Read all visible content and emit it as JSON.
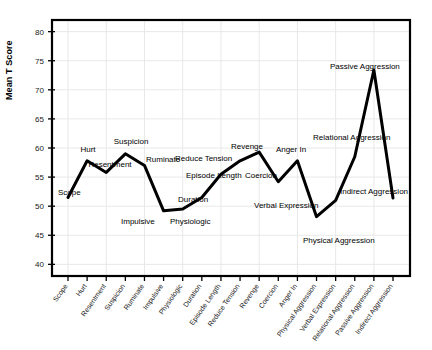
{
  "chart_data": {
    "type": "line",
    "title": "",
    "subtitle": "",
    "xlabel": "",
    "ylabel": "Mean T Score",
    "ylim": [
      38,
      82
    ],
    "yticks": [
      40,
      45,
      50,
      55,
      60,
      65,
      70,
      75,
      80
    ],
    "grid": true,
    "legend": "none",
    "line_color": "#000000",
    "categories": [
      "Scope",
      "Hurt",
      "Resentment",
      "Suspicion",
      "Ruminate",
      "Impulsive",
      "Physiologic",
      "Duration",
      "Episode Length",
      "Reduce Tension",
      "Revenge",
      "Coercion",
      "Anger In",
      "Physical Aggression",
      "Verbal Expression",
      "Relational Aggression",
      "Passive Aggression",
      "Indirect Aggression"
    ],
    "values": [
      51.5,
      57.8,
      55.8,
      59.0,
      57.0,
      49.2,
      49.5,
      51.5,
      55.5,
      57.8,
      59.3,
      54.2,
      57.8,
      48.2,
      51.0,
      58.5,
      73.4,
      51.4
    ],
    "annotations": [
      {
        "label": "Scope",
        "value": 51.5
      },
      {
        "label": "Hurt",
        "value": 57.8
      },
      {
        "label": "Resentment",
        "value": 55.8
      },
      {
        "label": "Suspicion",
        "value": 59.0
      },
      {
        "label": "Ruminate",
        "value": 57.0
      },
      {
        "label": "Impulsive",
        "value": 49.2
      },
      {
        "label": "Physiologic",
        "value": 49.5
      },
      {
        "label": "Duration",
        "value": 51.5
      },
      {
        "label": "Episode Length",
        "value": 55.5
      },
      {
        "label": "Reduce Tension",
        "value": 57.8
      },
      {
        "label": "Revenge",
        "value": 59.3
      },
      {
        "label": "Coercion",
        "value": 54.2
      },
      {
        "label": "Anger In",
        "value": 57.8
      },
      {
        "label": "Physical Aggression",
        "value": 48.2
      },
      {
        "label": "Verbal Expression",
        "value": 51.0
      },
      {
        "label": "Relational Aggression",
        "value": 58.5
      },
      {
        "label": "Passive Aggression",
        "value": 73.4
      },
      {
        "label": "Indirect Aggression",
        "value": 51.4
      }
    ]
  },
  "axis": {
    "y_title": "Mean T Score",
    "y_tick_labels": [
      "80",
      "75",
      "70",
      "65",
      "60",
      "55",
      "50",
      "45",
      "40"
    ],
    "x_tick_labels": [
      "Scope",
      "Hurt",
      "Resentment",
      "Suspicion",
      "Ruminate",
      "Impulsive",
      "Physiologic",
      "Duration",
      "Episode Length",
      "Reduce Tension",
      "Revenge",
      "Coercion",
      "Anger In",
      "Physical Aggression",
      "Verbal Expression",
      "Relational Aggression",
      "Passive Aggression",
      "Indirect Aggression"
    ]
  },
  "annotation_positions": [
    {
      "text": "Scope",
      "x": 58,
      "y": 195,
      "anchor": "start"
    },
    {
      "text": "Hurt",
      "x": 88,
      "y": 152,
      "anchor": "middle"
    },
    {
      "text": "Resentment",
      "x": 110,
      "y": 167,
      "anchor": "middle"
    },
    {
      "text": "Suspicion",
      "x": 131,
      "y": 144,
      "anchor": "middle"
    },
    {
      "text": "Ruminate",
      "x": 146,
      "y": 162,
      "anchor": "start"
    },
    {
      "text": "Impulsive",
      "x": 121,
      "y": 224,
      "anchor": "start"
    },
    {
      "text": "Physiologic",
      "x": 170,
      "y": 224,
      "anchor": "start"
    },
    {
      "text": "Duration",
      "x": 178,
      "y": 202,
      "anchor": "start"
    },
    {
      "text": "Episode Length",
      "x": 186,
      "y": 178,
      "anchor": "start"
    },
    {
      "text": "Reduce Tension",
      "x": 175,
      "y": 161,
      "anchor": "start"
    },
    {
      "text": "Revenge",
      "x": 247,
      "y": 149,
      "anchor": "middle"
    },
    {
      "text": "Coercion",
      "x": 245,
      "y": 178,
      "anchor": "start"
    },
    {
      "text": "Anger In",
      "x": 291,
      "y": 152,
      "anchor": "middle"
    },
    {
      "text": "Physical Aggression",
      "x": 303,
      "y": 243,
      "anchor": "start"
    },
    {
      "text": "Verbal Expression",
      "x": 254,
      "y": 208,
      "anchor": "start"
    },
    {
      "text": "Relational Aggression",
      "x": 313,
      "y": 140,
      "anchor": "start"
    },
    {
      "text": "Passive Aggression",
      "x": 330,
      "y": 69,
      "anchor": "start"
    },
    {
      "text": "Indirect Aggression",
      "x": 340,
      "y": 194,
      "anchor": "start"
    }
  ]
}
